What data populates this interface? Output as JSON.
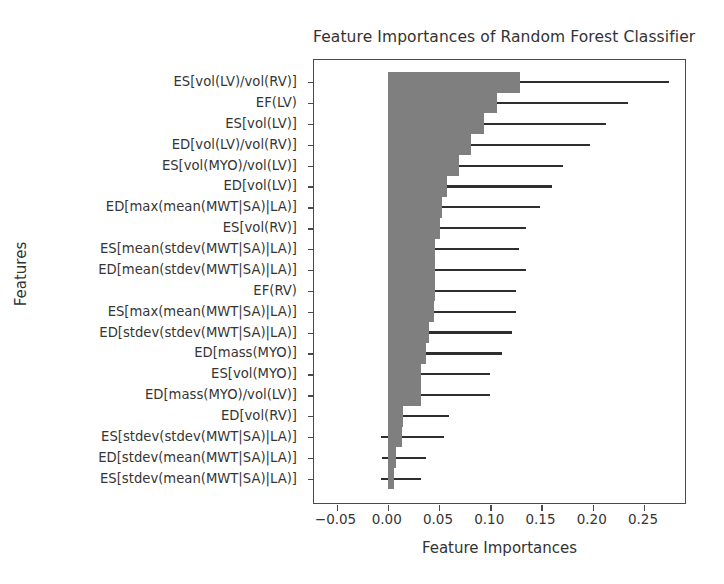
{
  "chart_data": {
    "type": "bar",
    "orientation": "horizontal",
    "title": "Feature Importances of Random Forest Classifier",
    "xlabel": "Feature Importances",
    "ylabel": "Features",
    "xlim": [
      -0.072,
      0.292
    ],
    "xticks": [
      -0.05,
      0.0,
      0.05,
      0.1,
      0.15,
      0.2,
      0.25
    ],
    "xticklabels": [
      "−0.05",
      "0.00",
      "0.05",
      "0.10",
      "0.15",
      "0.20",
      "0.25"
    ],
    "grid": false,
    "legend": null,
    "bar_color": "#7f7f7f",
    "error_color": "#2e2e2e",
    "categories": [
      "ES[vol(LV)/vol(RV)]",
      "EF(LV)",
      "ES[vol(LV)]",
      "ED[vol(LV)/vol(RV)]",
      "ES[vol(MYO)/vol(LV)]",
      "ED[vol(LV)]",
      "ED[max(mean(MWT|SA)|LA)]",
      "ES[vol(RV)]",
      "ES[mean(stdev(MWT|SA)|LA)]",
      "ED[mean(stdev(MWT|SA)|LA)]",
      "EF(RV)",
      "ES[max(mean(MWT|SA)|LA)]",
      "ED[stdev(stdev(MWT|SA)|LA)]",
      "ED[mass(MYO)]",
      "ES[vol(MYO)]",
      "ED[mass(MYO)/vol(LV)]",
      "ED[vol(RV)]",
      "ES[stdev(stdev(MWT|SA)|LA)]",
      "ED[stdev(mean(MWT|SA)|LA)]",
      "ES[stdev(mean(MWT|SA)|LA)]"
    ],
    "values": [
      0.129,
      0.107,
      0.094,
      0.081,
      0.07,
      0.058,
      0.053,
      0.051,
      0.046,
      0.046,
      0.046,
      0.045,
      0.04,
      0.037,
      0.032,
      0.032,
      0.015,
      0.014,
      0.008,
      0.006
    ],
    "err_low": [
      0.02,
      0.024,
      0.028,
      0.035,
      0.027,
      0.029,
      0.033,
      0.032,
      0.035,
      0.037,
      0.037,
      0.038,
      0.034,
      0.031,
      0.026,
      0.027,
      0.012,
      0.021,
      0.014,
      0.013
    ],
    "err_high": [
      0.145,
      0.127,
      0.119,
      0.116,
      0.101,
      0.102,
      0.096,
      0.084,
      0.082,
      0.089,
      0.079,
      0.08,
      0.081,
      0.074,
      0.068,
      0.068,
      0.045,
      0.041,
      0.029,
      0.026
    ],
    "ci_low": [
      0.109,
      0.083,
      0.066,
      0.046,
      0.043,
      0.029,
      0.02,
      0.019,
      0.011,
      0.009,
      0.009,
      0.007,
      0.006,
      0.006,
      0.006,
      0.005,
      0.003,
      -0.007,
      -0.006,
      -0.007
    ],
    "ci_high": [
      0.274,
      0.234,
      0.213,
      0.197,
      0.171,
      0.16,
      0.149,
      0.135,
      0.128,
      0.135,
      0.125,
      0.125,
      0.121,
      0.111,
      0.1,
      0.1,
      0.06,
      0.055,
      0.037,
      0.032
    ]
  }
}
